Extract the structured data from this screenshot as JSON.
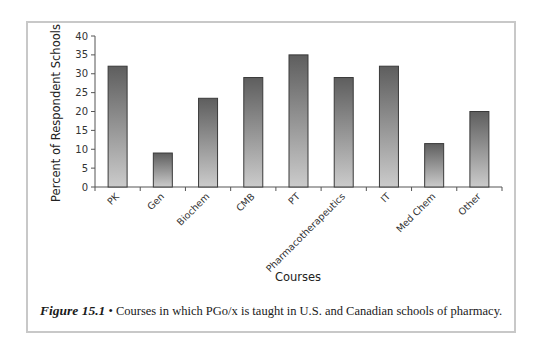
{
  "chart_data": {
    "type": "bar",
    "title": "",
    "xlabel": "Courses",
    "ylabel": "Percent of Respondent Schools",
    "categories": [
      "PK",
      "Gen",
      "Biochem",
      "CMB",
      "PT",
      "Pharmacotherapeutics",
      "IT",
      "Med Chem",
      "Other"
    ],
    "values": [
      32,
      9,
      23.5,
      29,
      35,
      29,
      32,
      11.5,
      20
    ],
    "ylim": [
      0,
      40
    ],
    "yticks": [
      0,
      5,
      10,
      15,
      20,
      25,
      30,
      35,
      40
    ],
    "grid": false,
    "legend": null,
    "bar_style": "vertical gray gradient (dark top to light bottom) with dark outline"
  },
  "caption": {
    "figure_number": "Figure 15.1",
    "bullet": "•",
    "text": "Courses in which PGo/x is taught in U.S. and Canadian schools of pharmacy."
  },
  "colors": {
    "bar_top": "#5e5e5e",
    "bar_bottom": "#cbcbcb",
    "bar_outline": "#3a3a3a",
    "axis": "#555555",
    "frame": "#c8c8c8"
  }
}
